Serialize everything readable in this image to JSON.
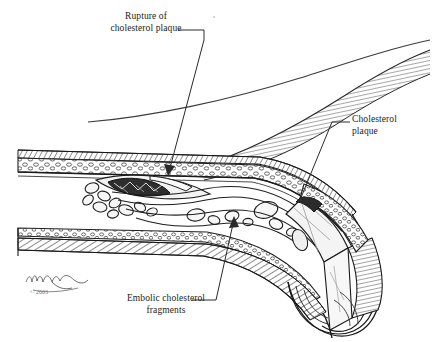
{
  "illustration": {
    "title": "Rupture of cholesterol plaque with embolic cholesterol fragments",
    "background_color": "#ffffff",
    "ink_color": "#1b1b1b",
    "labels": {
      "rupture": "Rupture of\ncholesterol plaque",
      "plaque": "Cholesterol\nplaque",
      "emboli": "Embolic cholesterol\nfragments"
    },
    "signature": {
      "artist": "Michael A. Cooley",
      "copyright": "© 2003"
    },
    "anatomy": {
      "vessel": "artery",
      "layers": [
        "intima",
        "media",
        "adventitia"
      ],
      "features": [
        "ruptured cholesterol plaque",
        "cholesterol crystal fragments in lumen",
        "blood flow streamlines",
        "cut-away cross section of plaque",
        "striated adjacent tissue"
      ]
    }
  }
}
